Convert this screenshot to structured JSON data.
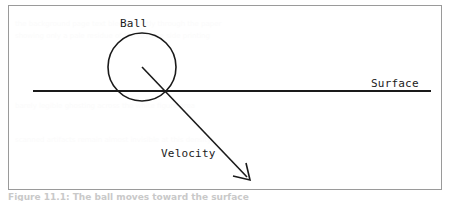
{
  "figure": {
    "caption": "Figure 11.1: The ball moves toward the surface",
    "frame": {
      "x": 8,
      "y": 5,
      "width": 434,
      "height": 185,
      "border_color": "#9a9a9a"
    }
  },
  "diagram": {
    "type": "physics-schematic",
    "stroke_color": "#1a1a1a",
    "background": "#ffffff",
    "labels": {
      "ball": "Ball",
      "surface": "Surface",
      "velocity": "Velocity"
    },
    "shapes": {
      "ball_circle": {
        "cx": 133,
        "cy": 61,
        "r": 34
      },
      "surface_line": {
        "x1": 24,
        "y1": 85,
        "x2": 422,
        "y2": 85
      },
      "velocity_arrow": {
        "x1": 133,
        "y1": 61,
        "x2": 240,
        "y2": 173
      }
    }
  },
  "ghost_text": {
    "lines": [
      "the background page text bleeds faintly through the paper",
      "showing only a pale residue of the reverse side printing",
      "barely legible ghosting across the white figure area",
      "scanned artifacts remain almost invisible at this density"
    ]
  }
}
